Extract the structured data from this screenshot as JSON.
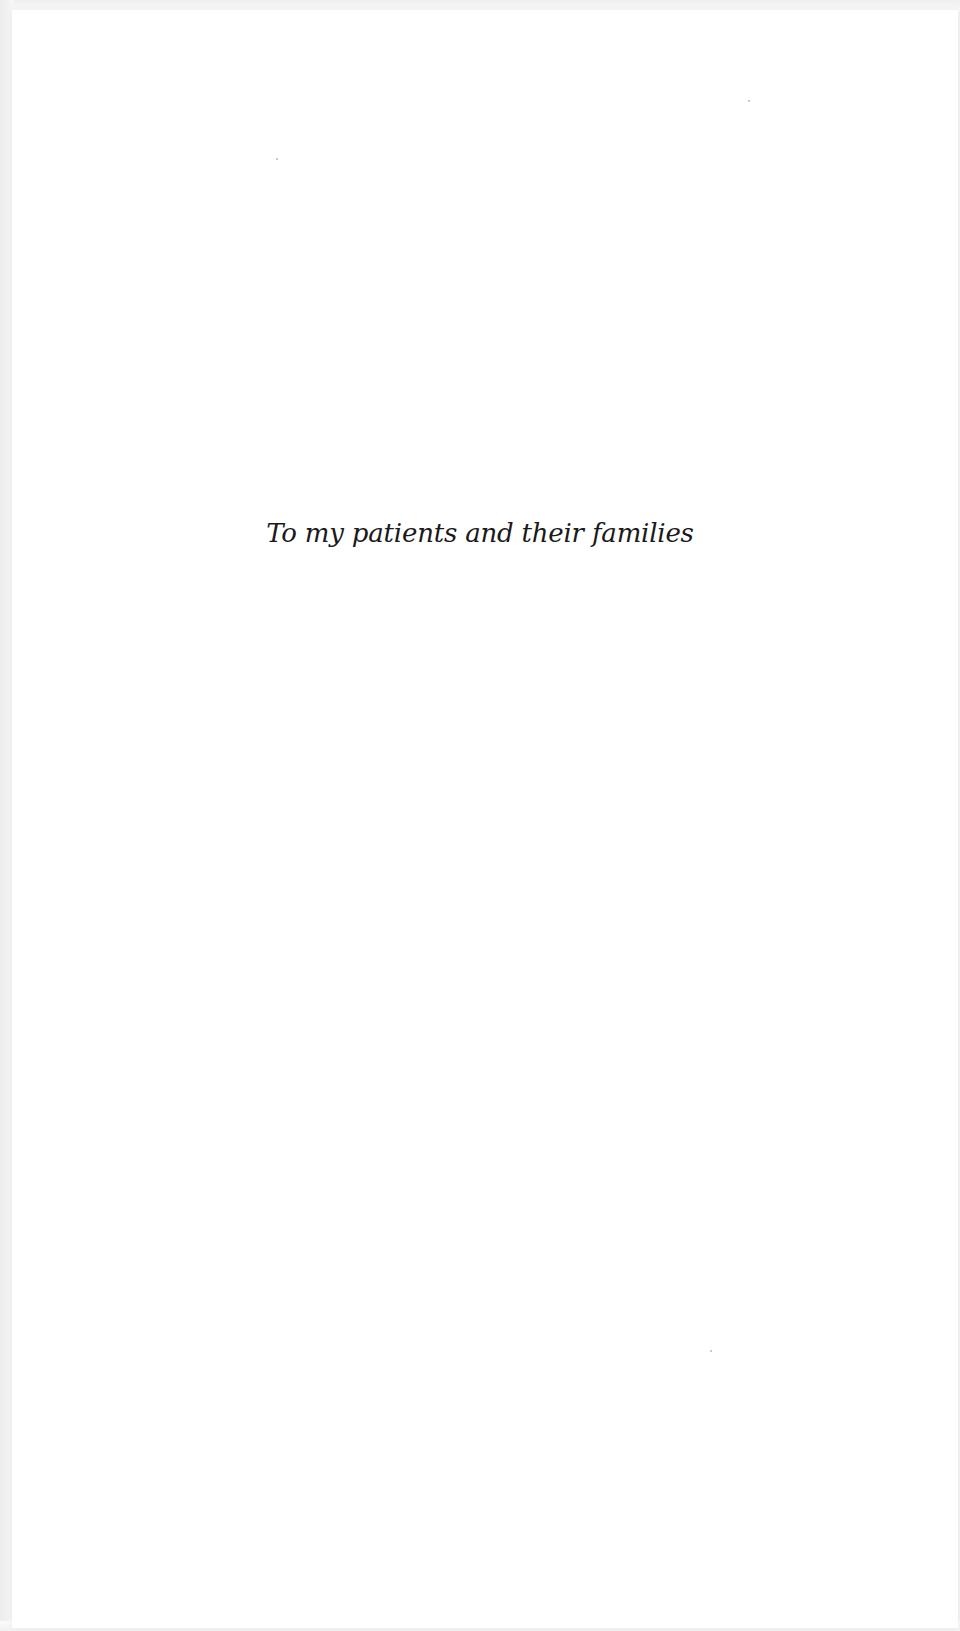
{
  "page": {
    "type": "dedication",
    "dedication_text": "To my patients and their families"
  }
}
